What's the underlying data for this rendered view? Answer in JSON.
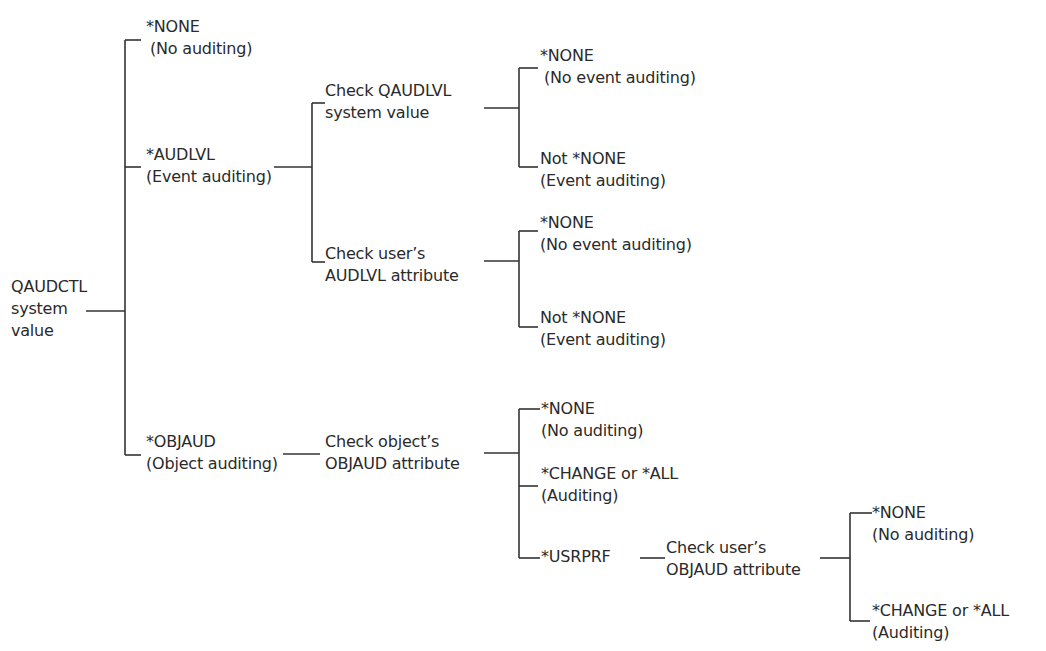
{
  "diagram": {
    "type": "decision-tree",
    "line_color": "#333333",
    "text_color": "#2a2a2a",
    "root": {
      "line1": "QAUDCTL",
      "line2": "system",
      "line3": "value"
    },
    "branches": {
      "none": {
        "value": "*NONE",
        "result": "(No auditing)"
      },
      "audlvl": {
        "value": "*AUDLVL",
        "result": "(Event auditing)",
        "checks": {
          "system": {
            "line1": "Check QAUDLVL",
            "line2": "system value",
            "outcomes": [
              {
                "value": "*NONE",
                "result": "(No event auditing)"
              },
              {
                "value": "Not *NONE",
                "result": "(Event auditing)"
              }
            ]
          },
          "user": {
            "line1": "Check user’s",
            "line2": "AUDLVL attribute",
            "outcomes": [
              {
                "value": "*NONE",
                "result": "(No event auditing)"
              },
              {
                "value": "Not *NONE",
                "result": "(Event auditing)"
              }
            ]
          }
        }
      },
      "objaud": {
        "value": "*OBJAUD",
        "result": "(Object auditing)",
        "check": {
          "line1": "Check object’s",
          "line2": "OBJAUD attribute",
          "outcomes": [
            {
              "value": "*NONE",
              "result": "(No auditing)"
            },
            {
              "value": "*CHANGE or *ALL",
              "result": "(Auditing)"
            },
            {
              "value": "*USRPRF"
            }
          ]
        },
        "usrprf_check": {
          "line1": "Check user’s",
          "line2": "OBJAUD attribute",
          "outcomes": [
            {
              "value": "*NONE",
              "result": "(No auditing)"
            },
            {
              "value": "*CHANGE or *ALL",
              "result": "(Auditing)"
            }
          ]
        }
      }
    }
  }
}
